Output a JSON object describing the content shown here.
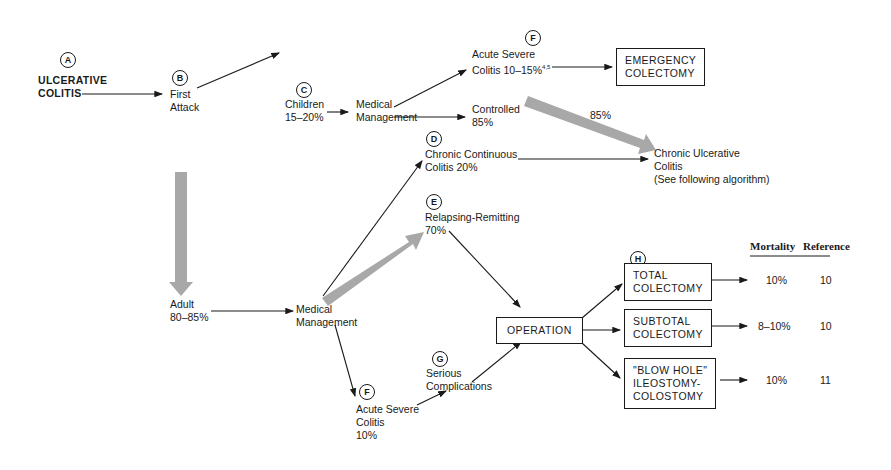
{
  "nodes": {
    "A": {
      "marker": "A",
      "label_line1": "ULCERATIVE",
      "label_line2": "COLITIS"
    },
    "B": {
      "marker": "B",
      "label_line1": "First",
      "label_line2": "Attack"
    },
    "C": {
      "marker": "C",
      "label_line1": "Children",
      "label_line2": "15–20%"
    },
    "med_mgmt_children": {
      "label_line1": "Medical",
      "label_line2": "Management"
    },
    "F_top": {
      "marker": "F",
      "label_line1": "Acute Severe",
      "label_line2": "Colitis 10–15%",
      "superscript": "4,5"
    },
    "controlled": {
      "label_line1": "Controlled",
      "label_line2": "85%"
    },
    "emergency": {
      "label_line1": "EMERGENCY",
      "label_line2": "COLECTOMY"
    },
    "gray_arrow_pct": "85%",
    "D": {
      "marker": "D",
      "label_line1": "Chronic Continuous",
      "label_line2": "Colitis 20%"
    },
    "chronic_uc": {
      "label_line1": "Chronic Ulcerative",
      "label_line2": "Colitis",
      "label_line3": "(See following algorithm)"
    },
    "E": {
      "marker": "E",
      "label_line1": "Relapsing-Remitting",
      "label_line2": "70%"
    },
    "adult": {
      "label_line1": "Adult",
      "label_line2": "80–85%"
    },
    "med_mgmt_adult": {
      "label_line1": "Medical",
      "label_line2": "Management"
    },
    "F_bottom": {
      "marker": "F",
      "label_line1": "Acute Severe",
      "label_line2": "Colitis",
      "label_line3": "10%"
    },
    "G": {
      "marker": "G",
      "label_line1": "Serious",
      "label_line2": "Complications"
    },
    "operation": {
      "label": "OPERATION"
    },
    "H": {
      "marker": "H"
    }
  },
  "table": {
    "headers": [
      "Mortality",
      "Reference"
    ],
    "rows": [
      {
        "procedure_line1": "TOTAL",
        "procedure_line2": "COLECTOMY",
        "procedure_line3": "",
        "mortality": "10%",
        "reference": "10"
      },
      {
        "procedure_line1": "SUBTOTAL",
        "procedure_line2": "COLECTOMY",
        "procedure_line3": "",
        "mortality": "8–10%",
        "reference": "10"
      },
      {
        "procedure_line1": "\"BLOW HOLE\"",
        "procedure_line2": "ILEOSTOMY-",
        "procedure_line3": "COLOSTOMY",
        "mortality": "10%",
        "reference": "11"
      }
    ]
  },
  "colors": {
    "ink": "#1a1a1a",
    "gray_arrow": "#a8a8a8"
  }
}
